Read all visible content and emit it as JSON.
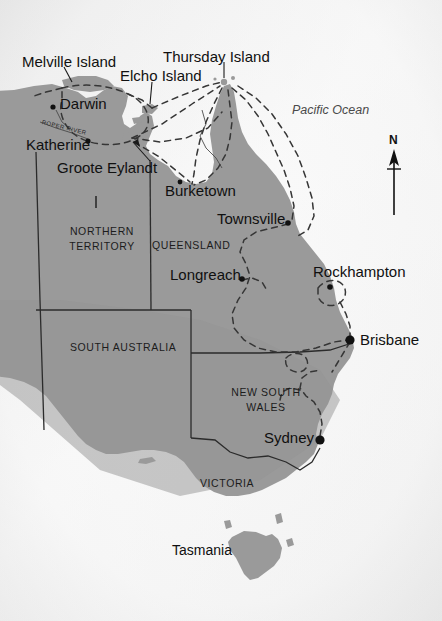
{
  "map": {
    "title": "Northern Australia map with air routes",
    "ocean_label": "Pacific Ocean",
    "compass_label": "N",
    "colors": {
      "land": "#9a9a9a",
      "land_dark": "#8f8f8f",
      "water": "#fbfbfb",
      "border": "#2b2b2b",
      "route": "#3a3a3a",
      "city_dot": "#111111",
      "text": "#141414",
      "vignette": "#c9c9c9"
    },
    "states": [
      {
        "name": "NORTHERN TERRITORY",
        "lines": [
          "NORTHERN",
          "TERRITORY"
        ],
        "x": 62,
        "y": 226
      },
      {
        "name": "QUEENSLAND",
        "lines": [
          "QUEENSLAND"
        ],
        "x": 152,
        "y": 240
      },
      {
        "name": "SOUTH AUSTRALIA",
        "lines": [
          "SOUTH AUSTRALIA"
        ],
        "x": 70,
        "y": 342
      },
      {
        "name": "NEW SOUTH WALES",
        "lines": [
          "NEW SOUTH",
          "WALES"
        ],
        "x": 228,
        "y": 387
      },
      {
        "name": "VICTORIA",
        "lines": [
          "VICTORIA"
        ],
        "x": 200,
        "y": 478
      }
    ],
    "cities": [
      {
        "name": "Darwin",
        "label_x": 60,
        "label_y": 103,
        "dot_x": 53,
        "dot_y": 107,
        "dot_r": 2.6,
        "anchor": "left"
      },
      {
        "name": "Katherine",
        "label_x": 26,
        "label_y": 145,
        "dot_x": 88,
        "dot_y": 141,
        "dot_r": 2.6,
        "anchor": "left"
      },
      {
        "name": "Burketown",
        "label_x": 165,
        "label_y": 191,
        "dot_x": 180,
        "dot_y": 182,
        "dot_r": 2.4,
        "anchor": "left"
      },
      {
        "name": "Townsville",
        "label_x": 217,
        "label_y": 219,
        "dot_x": 288,
        "dot_y": 223,
        "dot_r": 2.8,
        "anchor": "left"
      },
      {
        "name": "Longreach",
        "label_x": 170,
        "label_y": 275,
        "dot_x": 242,
        "dot_y": 279,
        "dot_r": 2.8,
        "anchor": "left"
      },
      {
        "name": "Rockhampton",
        "label_x": 313,
        "label_y": 272,
        "dot_x": 330,
        "dot_y": 287,
        "dot_r": 2.8,
        "anchor": "left"
      },
      {
        "name": "Brisbane",
        "label_x": 360,
        "label_y": 340,
        "dot_x": 350,
        "dot_y": 340,
        "dot_r": 4.6,
        "anchor": "left"
      },
      {
        "name": "Sydney",
        "label_x": 264,
        "label_y": 437,
        "dot_x": 320,
        "dot_y": 440,
        "dot_r": 4.6,
        "anchor": "left"
      }
    ],
    "islands": [
      {
        "name": "Melville Island",
        "label_x": 22,
        "label_y": 62,
        "leader": [
          [
            62,
            78
          ],
          [
            72,
            92
          ]
        ]
      },
      {
        "name": "Elcho Island",
        "label_x": 120,
        "label_y": 76,
        "leader": [
          [
            155,
            90
          ],
          [
            145,
            110
          ]
        ]
      },
      {
        "name": "Thursday Island",
        "label_x": 163,
        "label_y": 57,
        "leader": [
          [
            225,
            72
          ],
          [
            222,
            88
          ]
        ]
      },
      {
        "name": "Groote Eylandt",
        "label_x": 57,
        "label_y": 168,
        "leader": [
          [
            148,
            160
          ],
          [
            131,
            140
          ]
        ]
      }
    ],
    "tasmania_label": "Tasmania",
    "river_label": "ROPER RIVER"
  }
}
